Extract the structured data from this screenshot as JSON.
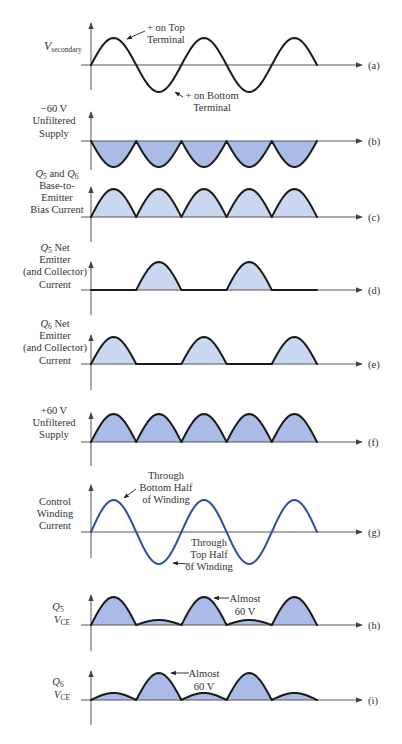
{
  "figure": {
    "x0": 91,
    "half_period": 45.2,
    "axis_left": 81,
    "axis_right": 362,
    "panels": [
      {
        "id": "a",
        "tag": "(a)",
        "baseline": 65,
        "amplitude": 27,
        "axis_top": 23,
        "axis_bottom": 90,
        "segments": [
          1,
          -1,
          1,
          -1,
          1
        ],
        "fill": null,
        "stroke": "#1a1a1a",
        "label": {
          "main": "V",
          "sub": "secondary"
        },
        "annotations": [
          {
            "lines": [
              "+ on Top",
              "Terminal"
            ]
          },
          {
            "lines": [
              "+ on Bottom",
              "Terminal"
            ]
          }
        ]
      },
      {
        "id": "b",
        "tag": "(b)",
        "baseline": 141,
        "amplitude": 26,
        "axis_top": 112,
        "axis_bottom": 170,
        "segments": [
          -1,
          -1,
          -1,
          -1,
          -1
        ],
        "fill": "#a9bbe6",
        "stroke": "#1a1a1a",
        "label": {
          "lines": [
            "−60 V",
            "Unfiltered",
            "Supply"
          ]
        }
      },
      {
        "id": "c",
        "tag": "(c)",
        "baseline": 217,
        "amplitude": 28,
        "axis_top": 187,
        "axis_bottom": 242,
        "segments": [
          1,
          1,
          1,
          1,
          1
        ],
        "fill": "#cad7f0",
        "stroke": "#1a1a1a",
        "label": {
          "q1": "Q",
          "q1_sub": "5",
          "mid": " and ",
          "q2": "Q",
          "q2_sub": "6",
          "lines": [
            "Base-to-",
            "Emitter",
            "Bias Current"
          ]
        }
      },
      {
        "id": "d",
        "tag": "(d)",
        "baseline": 290,
        "amplitude": 28,
        "axis_top": 262,
        "axis_bottom": 315,
        "segments": [
          0,
          1,
          0,
          1,
          0
        ],
        "fill": "#cad7f0",
        "stroke": "#1a1a1a",
        "label": {
          "q": "Q",
          "q_sub": "5",
          "q_rest": " Net",
          "lines": [
            "Emitter",
            "(and Collector)",
            "Current"
          ]
        }
      },
      {
        "id": "e",
        "tag": "(e)",
        "baseline": 364,
        "amplitude": 27,
        "axis_top": 335,
        "axis_bottom": 390,
        "segments": [
          1,
          0,
          1,
          0,
          1
        ],
        "fill": "#cad7f0",
        "stroke": "#1a1a1a",
        "label": {
          "q": "Q",
          "q_sub": "6",
          "q_rest": " Net",
          "lines": [
            "Emitter",
            "(and Collector)",
            "Current"
          ]
        }
      },
      {
        "id": "f",
        "tag": "(f)",
        "baseline": 442,
        "amplitude": 28,
        "axis_top": 413,
        "axis_bottom": 466,
        "segments": [
          1,
          1,
          1,
          1,
          1
        ],
        "fill": "#a9bbe6",
        "stroke": "#1a1a1a",
        "label": {
          "lines": [
            "+60 V",
            "Unfiltered",
            "Supply"
          ]
        }
      },
      {
        "id": "g",
        "tag": "(g)",
        "baseline": 532,
        "amplitude": 32,
        "axis_top": 485,
        "axis_bottom": 558,
        "segments": [
          1,
          -1,
          1,
          -1,
          1
        ],
        "fill": null,
        "stroke": "#2f4fa6",
        "label": {
          "lines": [
            "Control",
            "Winding",
            "Current"
          ]
        },
        "annotations": [
          {
            "lines": [
              "Through",
              "Bottom Half",
              "of Winding"
            ]
          },
          {
            "lines": [
              "Through",
              "Top Half",
              "of Winding"
            ]
          }
        ]
      },
      {
        "id": "h",
        "tag": "(h)",
        "baseline": 625,
        "amplitude": 28,
        "axis_top": 595,
        "axis_bottom": 651,
        "segments": [
          1,
          0.18,
          1,
          0.18,
          1
        ],
        "fill": "#a9bbe6",
        "stroke": "#1a1a1a",
        "label": {
          "q": "Q",
          "q_sub": "5",
          "v": "V",
          "v_sub": "CE"
        },
        "annotations": [
          {
            "lines": [
              "Almost",
              "60 V"
            ]
          }
        ]
      },
      {
        "id": "i",
        "tag": "(i)",
        "baseline": 700,
        "amplitude": 27,
        "axis_top": 671,
        "axis_bottom": 725,
        "segments": [
          0.26,
          1,
          0.26,
          1,
          0.26
        ],
        "fill": "#a9bbe6",
        "stroke": "#1a1a1a",
        "label": {
          "q": "Q",
          "q_sub": "6",
          "v": "V",
          "v_sub": "CE"
        },
        "annotations": [
          {
            "lines": [
              "Almost",
              "60 V"
            ]
          }
        ]
      }
    ]
  }
}
